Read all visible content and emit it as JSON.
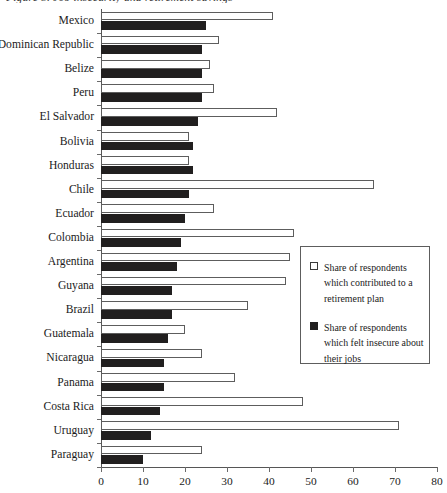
{
  "chart_data": {
    "type": "bar",
    "orientation": "horizontal",
    "title": "Figure 5. Job insecurity and retirement savings",
    "xlabel": "",
    "ylabel": "",
    "xlim": [
      0,
      80
    ],
    "xticks": [
      0,
      10,
      20,
      30,
      40,
      50,
      60,
      70,
      80
    ],
    "grid": false,
    "legend_position": "right-middle",
    "categories": [
      "Mexico",
      "Dominican Republic",
      "Belize",
      "Peru",
      "El Salvador",
      "Bolivia",
      "Honduras",
      "Chile",
      "Ecuador",
      "Colombia",
      "Argentina",
      "Guyana",
      "Brazil",
      "Guatemala",
      "Nicaragua",
      "Panama",
      "Costa Rica",
      "Uruguay",
      "Paraguay"
    ],
    "series": [
      {
        "name": "Share of respondents which contributed to a retirement plan",
        "style": "open",
        "values": [
          41,
          28,
          26,
          27,
          42,
          21,
          21,
          65,
          27,
          46,
          45,
          44,
          35,
          20,
          24,
          32,
          48,
          71,
          24
        ]
      },
      {
        "name": "Share of respondents which felt insecure about their jobs",
        "style": "filled",
        "values": [
          25,
          24,
          24,
          24,
          23,
          22,
          22,
          21,
          20,
          19,
          18,
          17,
          17,
          16,
          15,
          15,
          14,
          12,
          10
        ]
      }
    ]
  },
  "legend": {
    "items": [
      {
        "label": "Share of respondents which contributed to a retirement plan",
        "swatch": "open-square-icon"
      },
      {
        "label": "Share of respondents which felt insecure about their jobs",
        "swatch": "filled-square-icon"
      }
    ]
  }
}
